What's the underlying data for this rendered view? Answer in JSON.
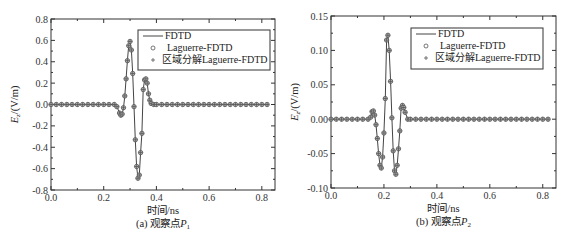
{
  "chart_data": [
    {
      "type": "line",
      "caption": "(a) 观察点P1",
      "caption_prefix": "(a) 观察点",
      "caption_var": "P",
      "caption_sub": "1",
      "xlabel": "时间/ns",
      "ylabel": "Ez/(V/m)",
      "ylabel_main": "E",
      "ylabel_sub": "z",
      "ylabel_unit": "/(V/m)",
      "xlim": [
        0.0,
        0.85
      ],
      "ylim": [
        -0.8,
        0.8
      ],
      "xticks": [
        "0.0",
        "0.2",
        "0.4",
        "0.6",
        "0.8"
      ],
      "xtick_values": [
        0.0,
        0.2,
        0.4,
        0.6,
        0.8
      ],
      "yticks": [
        "0.8",
        "0.6",
        "0.4",
        "0.2",
        "0.0",
        "-0.2",
        "-0.4",
        "-0.6",
        "-0.8"
      ],
      "ytick_values": [
        0.8,
        0.6,
        0.4,
        0.2,
        0.0,
        -0.2,
        -0.4,
        -0.6,
        -0.8
      ],
      "grid": false,
      "legend_position": "upper right",
      "legend": [
        "FDTD",
        "Laguerre-FDTD",
        "区域分解Laguerre-FDTD"
      ],
      "series": [
        {
          "name": "FDTD",
          "style": "line",
          "x": [
            0.0,
            0.02,
            0.04,
            0.06,
            0.08,
            0.1,
            0.12,
            0.14,
            0.16,
            0.18,
            0.2,
            0.22,
            0.24,
            0.25,
            0.26,
            0.265,
            0.27,
            0.275,
            0.28,
            0.285,
            0.29,
            0.295,
            0.3,
            0.305,
            0.31,
            0.315,
            0.32,
            0.325,
            0.33,
            0.335,
            0.34,
            0.345,
            0.35,
            0.355,
            0.36,
            0.365,
            0.37,
            0.375,
            0.38,
            0.39,
            0.4,
            0.42,
            0.44,
            0.46,
            0.48,
            0.5,
            0.52,
            0.54,
            0.56,
            0.58,
            0.6,
            0.62,
            0.64,
            0.66,
            0.68,
            0.7,
            0.72,
            0.74,
            0.76,
            0.78,
            0.8,
            0.82
          ],
          "y": [
            0,
            0,
            0,
            0,
            0,
            0,
            0,
            0,
            0,
            0,
            0,
            0,
            0,
            -0.02,
            -0.08,
            -0.1,
            -0.09,
            -0.03,
            0.08,
            0.24,
            0.41,
            0.55,
            0.59,
            0.51,
            0.29,
            -0.02,
            -0.33,
            -0.58,
            -0.69,
            -0.66,
            -0.45,
            -0.27,
            0.14,
            0.23,
            0.24,
            0.2,
            0.1,
            0.04,
            0.01,
            0.0,
            0,
            0,
            0,
            0,
            0,
            0,
            0,
            0,
            0,
            0,
            0,
            0,
            0,
            0,
            0,
            0,
            0,
            0,
            0,
            0,
            0,
            0
          ]
        },
        {
          "name": "Laguerre-FDTD",
          "style": "circle-markers",
          "same_as": "FDTD"
        },
        {
          "name": "区域分解Laguerre-FDTD",
          "style": "plus-markers",
          "same_as": "FDTD"
        }
      ]
    },
    {
      "type": "line",
      "caption": "(b) 观察点P2",
      "caption_prefix": "(b) 观察点",
      "caption_var": "P",
      "caption_sub": "2",
      "xlabel": "时间/ns",
      "ylabel": "Ez/(V/m)",
      "ylabel_main": "E",
      "ylabel_sub": "z",
      "ylabel_unit": "/(V/m)",
      "xlim": [
        0.0,
        0.85
      ],
      "ylim": [
        -0.1,
        0.15
      ],
      "xticks": [
        "0.0",
        "0.2",
        "0.4",
        "0.6",
        "0.8"
      ],
      "xtick_values": [
        0.0,
        0.2,
        0.4,
        0.6,
        0.8
      ],
      "yticks": [
        "0.15",
        "0.10",
        "0.05",
        "0.00",
        "-0.05",
        "-0.10"
      ],
      "ytick_values": [
        0.15,
        0.1,
        0.05,
        0.0,
        -0.05,
        -0.1
      ],
      "grid": false,
      "legend_position": "upper right",
      "legend": [
        "FDTD",
        "Laguerre-FDTD",
        "区域分解Laguerre-FDTD"
      ],
      "series": [
        {
          "name": "FDTD",
          "style": "line",
          "x": [
            0.0,
            0.02,
            0.04,
            0.06,
            0.08,
            0.1,
            0.12,
            0.14,
            0.15,
            0.155,
            0.16,
            0.165,
            0.17,
            0.175,
            0.18,
            0.185,
            0.19,
            0.195,
            0.2,
            0.205,
            0.21,
            0.215,
            0.22,
            0.225,
            0.23,
            0.235,
            0.24,
            0.245,
            0.25,
            0.255,
            0.26,
            0.265,
            0.27,
            0.275,
            0.28,
            0.29,
            0.3,
            0.32,
            0.34,
            0.36,
            0.38,
            0.4,
            0.42,
            0.44,
            0.46,
            0.48,
            0.5,
            0.52,
            0.54,
            0.56,
            0.58,
            0.6,
            0.62,
            0.64,
            0.66,
            0.68,
            0.7,
            0.72,
            0.74,
            0.76,
            0.78,
            0.8,
            0.82
          ],
          "y": [
            0,
            0,
            0,
            0,
            0,
            0,
            0,
            0.0,
            0.003,
            0.011,
            0.012,
            0.006,
            -0.008,
            -0.028,
            -0.05,
            -0.067,
            -0.071,
            -0.055,
            -0.02,
            0.03,
            0.115,
            0.122,
            0.1,
            0.055,
            0.002,
            -0.046,
            -0.075,
            -0.08,
            -0.067,
            -0.043,
            -0.017,
            0.016,
            0.02,
            0.017,
            0.01,
            0.0,
            0,
            0,
            0,
            0,
            0,
            0,
            0,
            0,
            0,
            0,
            0,
            0,
            0,
            0,
            0,
            0,
            0,
            0,
            0,
            0,
            0,
            0,
            0,
            0,
            0,
            0,
            0
          ]
        },
        {
          "name": "Laguerre-FDTD",
          "style": "circle-markers",
          "same_as": "FDTD"
        },
        {
          "name": "区域分解Laguerre-FDTD",
          "style": "plus-markers",
          "same_as": "FDTD"
        }
      ]
    }
  ],
  "colors": {
    "axis": "#333333",
    "line": "#444444",
    "marker": "#555555",
    "background": "#ffffff"
  }
}
